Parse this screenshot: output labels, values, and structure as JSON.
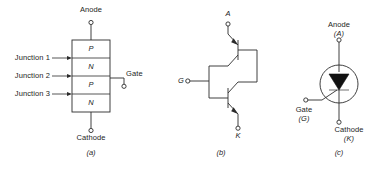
{
  "figure": {
    "stroke_color": "#2b2b2b",
    "text_color": "#1d1d1d",
    "background": "#ffffff"
  },
  "panel_a": {
    "caption": "(a)",
    "top_terminal": "Anode",
    "bottom_terminal": "Cathode",
    "side_terminal": "Gate",
    "layers": [
      {
        "label": "P"
      },
      {
        "label": "N"
      },
      {
        "label": "P"
      },
      {
        "label": "N"
      }
    ],
    "junctions": [
      {
        "label": "Junction 1"
      },
      {
        "label": "Junction 2"
      },
      {
        "label": "Junction 3"
      }
    ]
  },
  "panel_b": {
    "caption": "(b)",
    "anode_label": "A",
    "cathode_label": "K",
    "gate_label": "G",
    "transistors": [
      {
        "type": "pnp",
        "position": "upper"
      },
      {
        "type": "npn",
        "position": "lower"
      }
    ]
  },
  "panel_c": {
    "caption": "(c)",
    "anode_label": "Anode",
    "anode_symbol": "(A)",
    "cathode_label": "Cathode",
    "cathode_symbol": "(K)",
    "gate_label": "Gate",
    "gate_symbol": "(G)",
    "symbol": "scr-thyristor-symbol"
  }
}
